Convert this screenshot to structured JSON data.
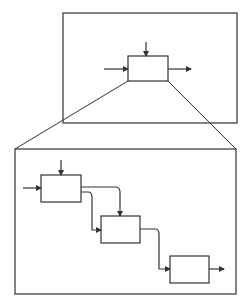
{
  "diagram": {
    "title": "",
    "stroke_color": "#333333",
    "background": "#ffffff",
    "overview": {
      "frame": {
        "x": 63,
        "y": 13,
        "w": 174,
        "h": 110
      },
      "process_box": {
        "x": 128,
        "y": 56,
        "w": 40,
        "h": 25
      },
      "arrows": [
        {
          "name": "top-input",
          "points": [
            [
              146,
              42
            ],
            [
              146,
              56
            ]
          ]
        },
        {
          "name": "left-input",
          "points": [
            [
              104,
              69
            ],
            [
              128,
              69
            ]
          ]
        },
        {
          "name": "right-output",
          "points": [
            [
              168,
              69
            ],
            [
              191,
              69
            ]
          ]
        }
      ]
    },
    "zoom_lines": [
      {
        "from": [
          128,
          81
        ],
        "to": [
          15,
          149
        ]
      },
      {
        "from": [
          168,
          81
        ],
        "to": [
          236,
          149
        ]
      }
    ],
    "detail": {
      "frame": {
        "x": 15,
        "y": 149,
        "w": 221,
        "h": 145
      },
      "boxes": [
        {
          "name": "step-1",
          "x": 41,
          "y": 175,
          "w": 40,
          "h": 27
        },
        {
          "name": "step-2",
          "x": 101,
          "y": 216,
          "w": 39,
          "h": 27
        },
        {
          "name": "step-3",
          "x": 170,
          "y": 256,
          "w": 39,
          "h": 27
        }
      ],
      "connectors": [
        {
          "name": "step1-top-input",
          "d": "M61,160 L61,175"
        },
        {
          "name": "step1-left-input",
          "d": "M23,188 L41,188"
        },
        {
          "name": "step1-to-step2-top",
          "d": "M81,187 L115,187 Q120,187 120,192 L120,216"
        },
        {
          "name": "step1-to-step2-left",
          "d": "M81,192 L88,192 Q92,192 92,197 L92,230 L101,230"
        },
        {
          "name": "step2-to-step3",
          "d": "M140,229 L155,229 Q159,229 159,234 L159,269 L170,269"
        },
        {
          "name": "step3-output",
          "d": "M209,269 L224,269"
        }
      ]
    }
  }
}
